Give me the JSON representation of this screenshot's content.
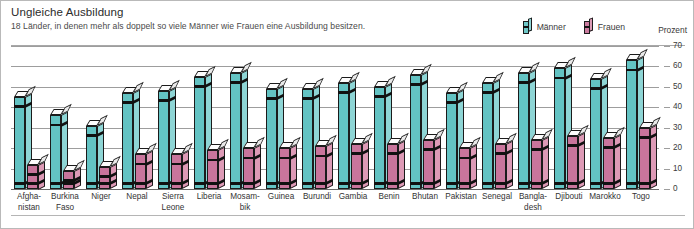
{
  "header": {
    "title": "Ungleiche Ausbildung",
    "subtitle": "18 Länder, in denen mehr als doppelt so viele Männer wie Frauen eine Ausbildung besitzen."
  },
  "legend": {
    "male_label": "Männer",
    "female_label": "Frauen",
    "unit_label": "Prozent"
  },
  "colors": {
    "male": "#63c3c3",
    "male_side": "#8ed5d5",
    "female": "#c9759c",
    "female_side": "#dd9ab6",
    "gridline": "#9d9d9d",
    "text": "#333333",
    "border": "#b9b9b9"
  },
  "chart_data": {
    "type": "bar",
    "title": "Ungleiche Ausbildung",
    "subtitle": "18 Länder, in denen mehr als doppelt so viele Männer wie Frauen eine Ausbildung besitzen.",
    "xlabel": "",
    "ylabel": "Prozent",
    "ylim": [
      0,
      70
    ],
    "yticks": [
      0,
      10,
      20,
      30,
      40,
      50,
      60,
      70
    ],
    "ytick_labels": [
      "0",
      "10",
      "20",
      "30",
      "40",
      "50",
      "60",
      "70"
    ],
    "grid": true,
    "legend_position": "top-right",
    "categories": [
      "Afgha-\nnistan",
      "Burkina\nFaso",
      "Niger",
      "Nepal",
      "Sierra\nLeone",
      "Liberia",
      "Mosam-\nbik",
      "Guinea",
      "Burundi",
      "Gambia",
      "Benin",
      "Bhutan",
      "Pakistan",
      "Senegal",
      "Bangla-\ndesh",
      "Djibouti",
      "Marokko",
      "Togo"
    ],
    "series": [
      {
        "name": "Männer",
        "color": "#63c3c3",
        "values": [
          45,
          36,
          31,
          47,
          48,
          55,
          57,
          49,
          49,
          52,
          50,
          56,
          47,
          52,
          57,
          59,
          54,
          63
        ]
      },
      {
        "name": "Frauen",
        "color": "#c9759c",
        "values": [
          12,
          9,
          11,
          17,
          17,
          19,
          20,
          20,
          21,
          22,
          22,
          24,
          20,
          22,
          24,
          26,
          25,
          30
        ]
      }
    ]
  }
}
